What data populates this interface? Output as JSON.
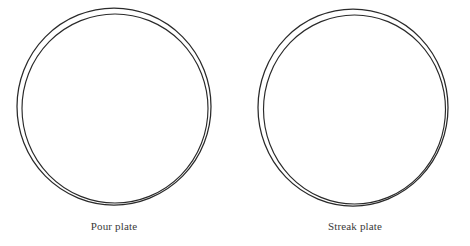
{
  "figure": {
    "background_color": "#ffffff",
    "stroke_color": "#2a2a2a",
    "caption_color": "#3a3a3a",
    "plates": [
      {
        "id": "pour-plate",
        "caption": "Pour plate",
        "outer_ring": {
          "cx": 114,
          "cy": 106.5,
          "rx": 97,
          "ry": 98.5
        },
        "inner_ring": {
          "cx": 115,
          "cy": 108.5,
          "rx": 93,
          "ry": 94.5
        }
      },
      {
        "id": "streak-plate",
        "caption": "Streak plate",
        "outer_ring": {
          "cx": 113,
          "cy": 107.5,
          "rx": 95,
          "ry": 98.5
        },
        "inner_ring": {
          "cx": 114.5,
          "cy": 109.5,
          "rx": 91,
          "ry": 94.5
        }
      }
    ]
  }
}
